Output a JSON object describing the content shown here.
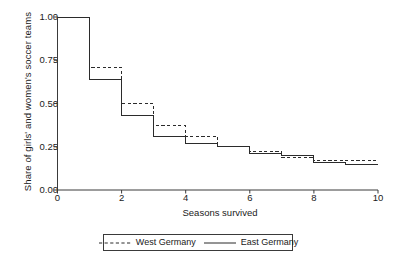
{
  "chart_data": {
    "type": "line",
    "subtype": "step-survival",
    "title": "",
    "xlabel": "Seasons survived",
    "ylabel": "Share of girls' and women's soccer teams",
    "xlim": [
      0,
      10
    ],
    "ylim": [
      0.0,
      1.0
    ],
    "xticks": [
      "0",
      "2",
      "4",
      "6",
      "8",
      "10"
    ],
    "xtick_values": [
      0,
      2,
      4,
      6,
      8,
      10
    ],
    "yticks": [
      "0.00",
      "0.25",
      "0.50",
      "0.75",
      "1.00"
    ],
    "ytick_values": [
      0.0,
      0.25,
      0.5,
      0.75,
      1.0
    ],
    "grid": false,
    "legend_position": "below-axis",
    "x": [
      0,
      1,
      2,
      3,
      4,
      5,
      6,
      7,
      8,
      9,
      10
    ],
    "series": [
      {
        "name": "West Germany",
        "style": "dashed",
        "color": "#2b2b2b",
        "values": [
          1.0,
          0.71,
          0.5,
          0.37,
          0.31,
          0.25,
          0.22,
          0.19,
          0.17,
          0.17,
          null
        ]
      },
      {
        "name": "East Germany",
        "style": "solid",
        "color": "#2b2b2b",
        "values": [
          1.0,
          0.64,
          0.43,
          0.31,
          0.27,
          0.25,
          0.21,
          0.2,
          0.16,
          0.15,
          0.15
        ]
      }
    ]
  },
  "axes": {
    "x_title": "Seasons survived",
    "y_title": "Share of girls' and women's soccer teams"
  },
  "legend": {
    "items": [
      {
        "label": "West Germany",
        "style": "dashed"
      },
      {
        "label": "East Germany",
        "style": "solid"
      }
    ]
  },
  "colors": {
    "axis": "#3a3a3a",
    "line": "#2b2b2b",
    "text": "#1a1a1a",
    "background": "#ffffff"
  }
}
